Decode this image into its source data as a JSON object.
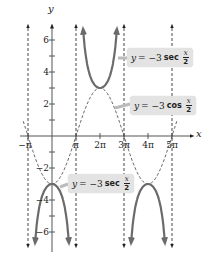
{
  "chart_data": {
    "type": "line",
    "title": "",
    "xlabel": "x",
    "ylabel": "y",
    "xlim_pi": [
      -1.2,
      5.5
    ],
    "ylim": [
      -6.5,
      7
    ],
    "x_ticks": [
      {
        "value_pi": -1,
        "label": "−π"
      },
      {
        "value_pi": 1,
        "label": "π"
      },
      {
        "value_pi": 2,
        "label": "2π"
      },
      {
        "value_pi": 3,
        "label": "3π"
      },
      {
        "value_pi": 4,
        "label": "4π"
      },
      {
        "value_pi": 5,
        "label": "5π"
      }
    ],
    "y_ticks": [
      {
        "value": 6,
        "label": "6"
      },
      {
        "value": 4,
        "label": "4"
      },
      {
        "value": 2,
        "label": "2"
      },
      {
        "value": -2,
        "label": "−2"
      },
      {
        "value": -4,
        "label": "−4"
      },
      {
        "value": -6,
        "label": "−6"
      }
    ],
    "y_minor_ticks": [
      5,
      3,
      1,
      -1,
      -3,
      -5
    ],
    "asymptotes_pi": [
      -1,
      1,
      3,
      5
    ],
    "series": [
      {
        "name": "y = −3 sec x/2",
        "style": "solid",
        "color": "#6b6b6b",
        "branches": [
          {
            "x_pi": [
              -0.7,
              -0.6,
              -0.5,
              -0.4,
              -0.2,
              0,
              0.2,
              0.4,
              0.5,
              0.6,
              0.7
            ],
            "y": [
              -6.6,
              -5.1,
              -4.24,
              -3.71,
              -3.15,
              -3,
              -3.15,
              -3.71,
              -4.24,
              -5.1,
              -6.6
            ]
          },
          {
            "x_pi": [
              1.3,
              1.4,
              1.5,
              1.6,
              1.8,
              2,
              2.2,
              2.4,
              2.5,
              2.6,
              2.7
            ],
            "y": [
              6.6,
              5.1,
              4.24,
              3.71,
              3.15,
              3,
              3.15,
              3.71,
              4.24,
              5.1,
              6.6
            ]
          },
          {
            "x_pi": [
              3.3,
              3.4,
              3.5,
              3.6,
              3.8,
              4,
              4.2,
              4.4,
              4.5,
              4.6,
              4.7
            ],
            "y": [
              -6.6,
              -5.1,
              -4.24,
              -3.71,
              -3.15,
              -3,
              -3.15,
              -3.71,
              -4.24,
              -5.1,
              -6.6
            ]
          }
        ]
      },
      {
        "name": "y = −3 cos x/2",
        "style": "dashed",
        "color": "#555555",
        "x_pi": [
          -1.2,
          -1,
          -0.5,
          0,
          0.5,
          1,
          1.5,
          2,
          2.5,
          3,
          3.5,
          4,
          4.5,
          5,
          5.2
        ],
        "y": [
          -0.93,
          0,
          2.12,
          -3,
          -2.12,
          0,
          2.12,
          3,
          2.12,
          0,
          -2.12,
          -3,
          -2.12,
          0,
          0.93
        ]
      }
    ],
    "annotations": [
      {
        "text": "y = −3 sec x/2",
        "points_to": "upper sec branch"
      },
      {
        "text": "y = −3 cos x/2",
        "points_to": "cosine curve"
      },
      {
        "text": "y = −3 sec x/2",
        "points_to": "lower sec branch"
      }
    ],
    "grid": false,
    "legend": "none"
  },
  "labels": {
    "upper_sec": {
      "y": "y",
      "eq": "= −3",
      "fn": "sec",
      "num": "x",
      "den": "2"
    },
    "cos": {
      "y": "y",
      "eq": "= −3",
      "fn": "cos",
      "num": "x",
      "den": "2"
    },
    "lower_sec": {
      "y": "y",
      "eq": "= −3",
      "fn": "sec",
      "num": "x",
      "den": "2"
    }
  },
  "axes": {
    "x_name": "x",
    "y_name": "y"
  }
}
